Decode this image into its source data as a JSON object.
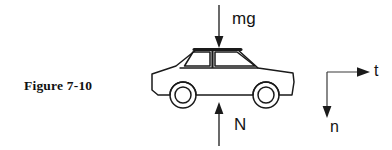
{
  "figure": {
    "caption": "Figure 7-10",
    "canvas": {
      "width": 392,
      "height": 150,
      "background": "#ffffff"
    },
    "ink_color": "#1a1a1a"
  },
  "forces": [
    {
      "id": "weight",
      "label": "mg",
      "direction": "down",
      "arrow": {
        "x": 219,
        "y_start": 5,
        "y_end": 47,
        "head": "down"
      },
      "label_position": {
        "x": 232,
        "y": 10
      }
    },
    {
      "id": "normal",
      "label": "N",
      "direction": "up",
      "arrow": {
        "x": 219,
        "y_start": 146,
        "y_end": 103,
        "head": "up"
      },
      "label_position": {
        "x": 234,
        "y": 116
      }
    }
  ],
  "axes": {
    "origin": {
      "x": 327,
      "y": 72
    },
    "tangential": {
      "label": "t",
      "direction": "right",
      "arrow": {
        "x_start": 327,
        "x_end": 369,
        "y": 72,
        "head": "right"
      },
      "label_position": {
        "x": 374,
        "y": 63
      }
    },
    "normal": {
      "label": "n",
      "direction": "down",
      "arrow": {
        "x": 327,
        "y_start": 72,
        "y_end": 117,
        "head": "down"
      },
      "label_position": {
        "x": 330,
        "y": 119
      }
    }
  },
  "car": {
    "name": "sedan-side-view",
    "bounds": {
      "x": 150,
      "y": 47,
      "width": 145,
      "height": 58
    },
    "roof": {
      "x_start": 189,
      "x_end": 255,
      "y": 49,
      "stroke_width": 3
    },
    "wheels": [
      {
        "id": "front-wheel",
        "cx": 183,
        "cy": 95,
        "r_outer": 13,
        "r_inner": 8
      },
      {
        "id": "rear-wheel",
        "cx": 266,
        "cy": 95,
        "r_outer": 13,
        "r_inner": 8
      }
    ],
    "windows": [
      {
        "id": "front-window",
        "points": "192,52 211,52 211,68 185,68"
      },
      {
        "id": "rear-window",
        "points": "216,52 252,52 258,68 216,68"
      }
    ]
  }
}
